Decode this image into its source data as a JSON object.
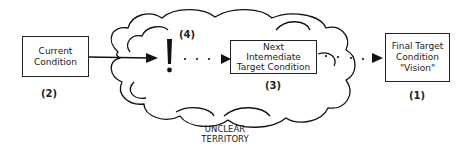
{
  "diagram": {
    "type": "improvement-kata-flow",
    "cloud": {
      "label_line1": "UNCLEAR",
      "label_line2": "TERRITORY"
    },
    "nodes": [
      {
        "id": "current",
        "lines": [
          "Current",
          "Condition"
        ],
        "number": "(2)"
      },
      {
        "id": "obstacle",
        "symbol": "!",
        "number": "(4)"
      },
      {
        "id": "next",
        "lines": [
          "Next",
          "Intemediate",
          "Target Condition"
        ],
        "number": "(3)"
      },
      {
        "id": "final",
        "lines": [
          "Final Target",
          "Condition",
          "\"Vision\""
        ],
        "number": "(1)"
      }
    ],
    "edges": [
      {
        "from": "current",
        "to": "obstacle",
        "style": "solid-arrow"
      },
      {
        "from": "obstacle",
        "to": "next",
        "style": "dotted-arrow"
      },
      {
        "from": "next",
        "to": "final",
        "style": "dotted-arrow"
      }
    ]
  }
}
